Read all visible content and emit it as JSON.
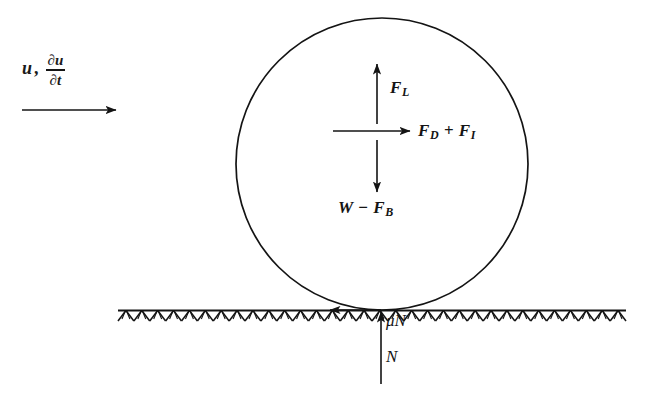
{
  "figure": {
    "background_color": "#ffffff",
    "ink_color": "#141414"
  },
  "flow": {
    "velocity_symbol": "u",
    "separator": ",",
    "acceleration": {
      "numerator": "∂u",
      "denominator": "∂t"
    },
    "arrow_name": "flow-direction-arrow",
    "arrow_direction": "right"
  },
  "particle": {
    "name": "spherical-particle",
    "shape": "circle",
    "center_x": 382,
    "center_y": 164,
    "radius": 146,
    "stroke_color": "#141414"
  },
  "bed": {
    "name": "bed-surface",
    "label": "hatched-ground",
    "line_y": 310,
    "x_start": 118,
    "x_end": 626,
    "hatch_count": 64
  },
  "forces": [
    {
      "key": "lift",
      "label": "F",
      "subscript": "L",
      "full_text": "F_L",
      "direction": "up",
      "name": "force-lift"
    },
    {
      "key": "drag_inertia",
      "label_1": "F",
      "subscript_1": "D",
      "operator": "+",
      "label_2": "F",
      "subscript_2": "I",
      "full_text": "F_D + F_I",
      "direction": "right",
      "name": "force-drag-plus-inertia"
    },
    {
      "key": "weight_buoyancy",
      "label_1": "W",
      "operator": "−",
      "label_2": "F",
      "subscript_2": "B",
      "full_text": "W − F_B",
      "direction": "down",
      "name": "force-weight-minus-buoyancy"
    },
    {
      "key": "friction",
      "label": "μN",
      "full_text": "μN",
      "direction": "left",
      "name": "force-friction"
    },
    {
      "key": "normal",
      "label": "N",
      "full_text": "N",
      "direction": "up",
      "name": "force-normal"
    }
  ],
  "labels": {
    "lift": {
      "base": "F",
      "sub": "L"
    },
    "drag": {
      "base": "F",
      "sub": "D"
    },
    "inertia": {
      "base": "F",
      "sub": "I"
    },
    "weight": {
      "base": "W"
    },
    "buoyancy": {
      "base": "F",
      "sub": "B"
    },
    "plus": "+",
    "minus": "−",
    "friction": "μN",
    "normal": "N"
  }
}
